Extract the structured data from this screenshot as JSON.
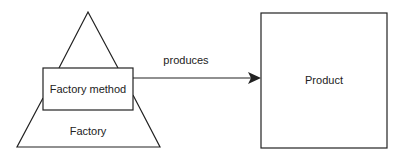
{
  "diagram": {
    "nodes": {
      "factory_method": {
        "label": "Factory method",
        "shape": "rectangle"
      },
      "factory": {
        "label": "Factory",
        "shape": "pyramid"
      },
      "product": {
        "label": "Product",
        "shape": "rectangle"
      }
    },
    "edges": [
      {
        "from": "factory_method",
        "to": "product",
        "label": "produces",
        "arrow": "filled-triangle"
      }
    ],
    "colors": {
      "stroke": "#222222",
      "background": "#ffffff",
      "text": "#222222"
    }
  }
}
